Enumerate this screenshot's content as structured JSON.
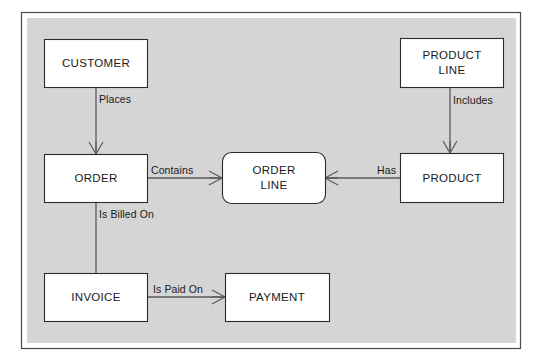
{
  "diagram": {
    "type": "entity-relationship-diagram",
    "colors": {
      "panel_background": "#d5d5d5",
      "page_background": "#ffffff",
      "entity_fill": "#ffffff",
      "entity_stroke": "#2b2b2b",
      "connector_stroke": "#5a5a5a",
      "frame_stroke": "#4a4a4a",
      "text": "#1a1a1a"
    },
    "entities": [
      {
        "id": "customer",
        "label": "CUSTOMER",
        "line1": "CUSTOMER",
        "line2": "",
        "shape": "rectangle"
      },
      {
        "id": "order",
        "label": "ORDER",
        "line1": "ORDER",
        "line2": "",
        "shape": "rectangle"
      },
      {
        "id": "invoice",
        "label": "INVOICE",
        "line1": "INVOICE",
        "line2": "",
        "shape": "rectangle"
      },
      {
        "id": "payment",
        "label": "PAYMENT",
        "line1": "PAYMENT",
        "line2": "",
        "shape": "rectangle"
      },
      {
        "id": "order-line",
        "label": "ORDER LINE",
        "line1": "ORDER",
        "line2": "LINE",
        "shape": "rounded-rectangle"
      },
      {
        "id": "product",
        "label": "PRODUCT",
        "line1": "PRODUCT",
        "line2": "",
        "shape": "rectangle"
      },
      {
        "id": "product-line",
        "label": "PRODUCT LINE",
        "line1": "PRODUCT",
        "line2": "LINE",
        "shape": "rectangle"
      }
    ],
    "relationships": [
      {
        "id": "places",
        "label": "Places",
        "from": "CUSTOMER",
        "to": "ORDER",
        "many_end": "ORDER"
      },
      {
        "id": "is-billed-on",
        "label": "Is Billed On",
        "from": "ORDER",
        "to": "INVOICE",
        "many_end": ""
      },
      {
        "id": "is-paid-on",
        "label": "Is Paid On",
        "from": "PAYMENT",
        "to": "INVOICE",
        "many_end": "INVOICE"
      },
      {
        "id": "contains",
        "label": "Contains",
        "from": "ORDER",
        "to": "ORDER LINE",
        "many_end": "ORDER LINE"
      },
      {
        "id": "has",
        "label": "Has",
        "from": "ORDER LINE",
        "to": "PRODUCT",
        "many_end": "ORDER LINE"
      },
      {
        "id": "includes",
        "label": "Includes",
        "from": "PRODUCT LINE",
        "to": "PRODUCT",
        "many_end": "PRODUCT"
      }
    ]
  }
}
